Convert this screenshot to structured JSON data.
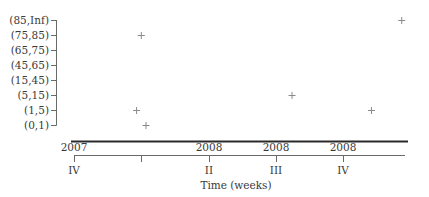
{
  "chart_data": {
    "type": "scatter",
    "title": "",
    "xlabel": "Time (weeks)",
    "ylabel": "",
    "marker": "plus",
    "grid": false,
    "legend": null,
    "y_categories": [
      "(0,1)",
      "(1,5)",
      "(5,15)",
      "(15,45)",
      "(45,65)",
      "(65,75)",
      "(75,85)",
      "(85,Inf)"
    ],
    "x_ticks": [
      {
        "year": "2007",
        "quarter": "IV",
        "pos": 0
      },
      {
        "year": "",
        "quarter": "",
        "pos": 1
      },
      {
        "year": "2008",
        "quarter": "II",
        "pos": 2
      },
      {
        "year": "2008",
        "quarter": "III",
        "pos": 3
      },
      {
        "year": "2008",
        "quarter": "IV",
        "pos": 4
      }
    ],
    "x_unit": "quarters after 2007 Q4",
    "xlim": [
      0,
      4.95
    ],
    "points": [
      {
        "x": 0.93,
        "y": "(1,5)"
      },
      {
        "x": 1.0,
        "y": "(75,85)"
      },
      {
        "x": 1.07,
        "y": "(0,1)"
      },
      {
        "x": 3.24,
        "y": "(5,15)"
      },
      {
        "x": 4.42,
        "y": "(1,5)"
      },
      {
        "x": 4.87,
        "y": "(85,Inf)"
      }
    ]
  },
  "labels": {
    "y": [
      "(85,Inf)",
      "(75,85)",
      "(65,75)",
      "(45,65)",
      "(15,45)",
      "(5,15)",
      "(1,5)",
      "(0,1)"
    ],
    "x_years": [
      "2007",
      "2008",
      "2008",
      "2008"
    ],
    "x_quarters": [
      "IV",
      "II",
      "III",
      "IV"
    ],
    "xlabel": "Time (weeks)"
  }
}
